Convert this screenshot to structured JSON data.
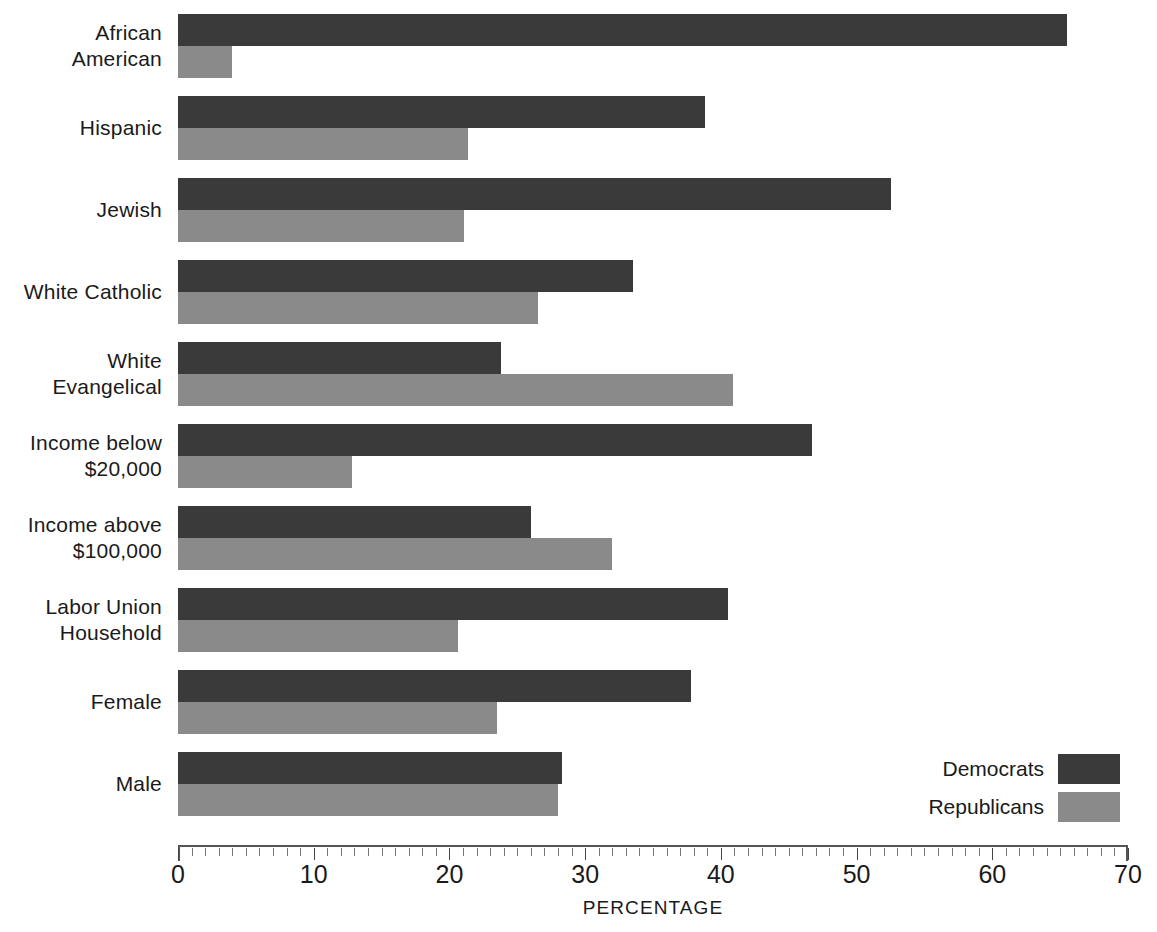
{
  "chart_data": {
    "type": "bar",
    "orientation": "horizontal",
    "title": "",
    "xlabel": "PERCENTAGE",
    "ylabel": "",
    "xlim": [
      0,
      70
    ],
    "xticks": [
      0,
      10,
      20,
      30,
      40,
      50,
      60,
      70
    ],
    "xtick_labels": [
      "0",
      "10",
      "20",
      "30",
      "40",
      "50",
      "60",
      "70"
    ],
    "minor_tick_step": 1,
    "grid": false,
    "legend_position": "bottom-right",
    "categories": [
      "African American",
      "Hispanic",
      "Jewish",
      "White Catholic",
      "White Evangelical",
      "Income below $20,000",
      "Income above $100,000",
      "Labor Union Household",
      "Female",
      "Male"
    ],
    "category_lines": [
      [
        "African",
        "American"
      ],
      [
        "Hispanic"
      ],
      [
        "Jewish"
      ],
      [
        "White Catholic"
      ],
      [
        "White",
        "Evangelical"
      ],
      [
        "Income below",
        "$20,000"
      ],
      [
        "Income above",
        "$100,000"
      ],
      [
        "Labor Union",
        "Household"
      ],
      [
        "Female"
      ],
      [
        "Male"
      ]
    ],
    "series": [
      {
        "name": "Democrats",
        "color": "#3a3a3a",
        "values": [
          65.5,
          38.8,
          52.5,
          33.5,
          23.8,
          46.7,
          26.0,
          40.5,
          37.8,
          28.3
        ]
      },
      {
        "name": "Republicans",
        "color": "#8a8a8a",
        "values": [
          4.0,
          21.4,
          21.1,
          26.5,
          40.9,
          12.8,
          32.0,
          20.6,
          23.5,
          28.0
        ]
      }
    ]
  },
  "legend": {
    "entries": [
      {
        "label": "Democrats",
        "color": "#3a3a3a"
      },
      {
        "label": "Republicans",
        "color": "#8a8a8a"
      }
    ]
  },
  "axis": {
    "title": "PERCENTAGE",
    "min": 0,
    "max": 70
  },
  "colors": {
    "democrat": "#3a3a3a",
    "republican": "#8a8a8a",
    "axis": "#555555",
    "text": "#1a1a1a",
    "background": "#ffffff"
  }
}
